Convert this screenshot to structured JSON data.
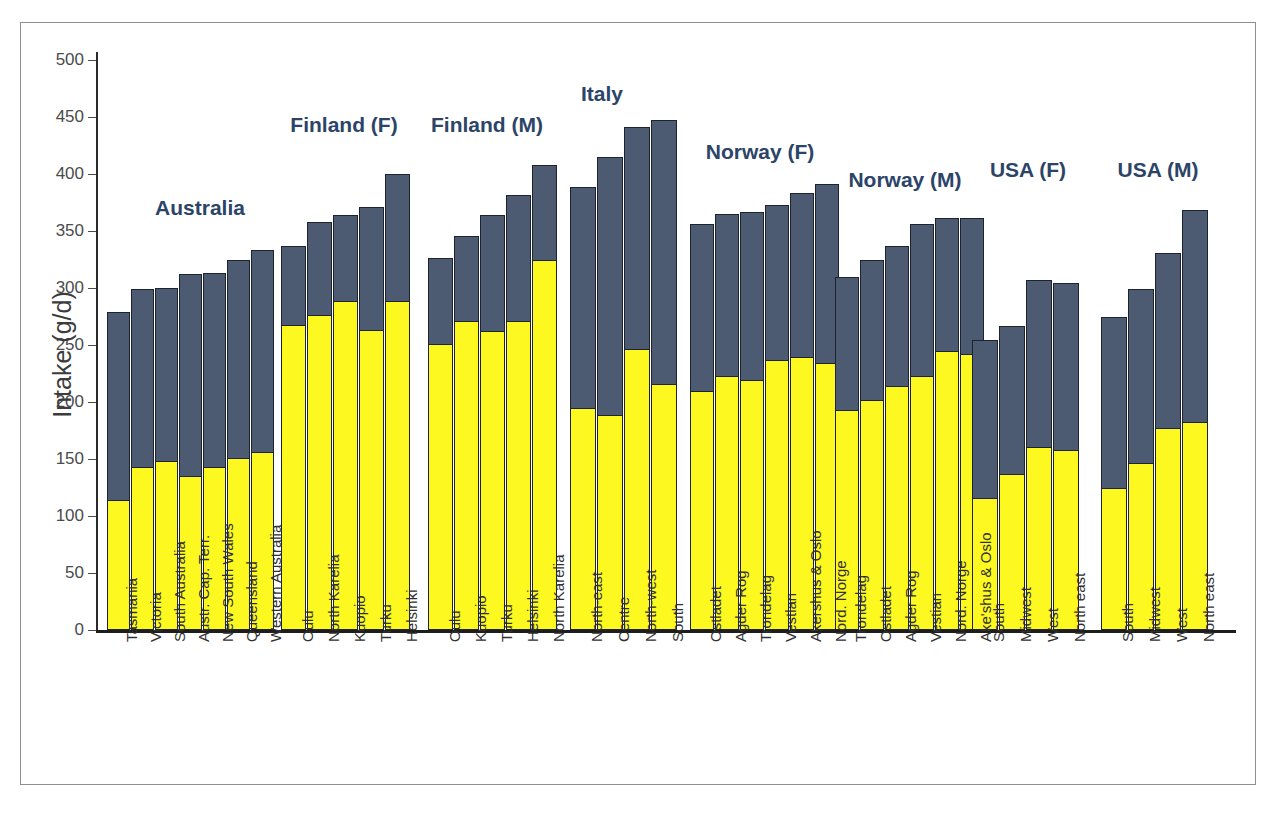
{
  "figure": {
    "y_axis_title": "Intake (g/d)",
    "colors": {
      "upper_segment": "#4d5b72",
      "lower_segment": "#fdf81f",
      "group_title": "#2b4468",
      "axis": "#1d1d1d",
      "frame": "#8e8e8e"
    }
  },
  "chart_data": {
    "type": "bar",
    "subtype": "stacked",
    "title": "",
    "xlabel": "",
    "ylabel": "Intake (g/d)",
    "ylim": [
      0,
      500
    ],
    "yticks": [
      0,
      50,
      100,
      150,
      200,
      250,
      300,
      350,
      400,
      450,
      500
    ],
    "grid": false,
    "legend": "none",
    "series": [
      {
        "name": "lower-segment",
        "color": "#fdf81f"
      },
      {
        "name": "upper-segment",
        "color": "#4d5b72"
      }
    ],
    "groups": [
      {
        "label": "Australia",
        "categories": [
          "Tasmania",
          "Victoria",
          "South Australia",
          "Austr. Cap. Terr.",
          "New South Wales",
          "Queensland",
          "Western Australia"
        ],
        "lower": [
          113,
          142,
          147,
          134,
          142,
          150,
          155
        ],
        "total": [
          279,
          299,
          300,
          312,
          313,
          325,
          333
        ]
      },
      {
        "label": "Finland (F)",
        "categories": [
          "Oulu",
          "North Karelia",
          "Kuopio",
          "Turku",
          "Helsinki"
        ],
        "lower": [
          267,
          275,
          288,
          262,
          288
        ],
        "total": [
          337,
          358,
          364,
          371,
          400
        ]
      },
      {
        "label": "Finland (M)",
        "categories": [
          "Oulu",
          "Kuopio",
          "Turku",
          "Helsinki",
          "North Karelia"
        ],
        "lower": [
          250,
          270,
          261,
          270,
          324
        ],
        "total": [
          326,
          346,
          364,
          382,
          408
        ]
      },
      {
        "label": "Italy",
        "categories": [
          "North-east",
          "Centre",
          "North-west",
          "South"
        ],
        "lower": [
          194,
          188,
          246,
          215
        ],
        "total": [
          389,
          415,
          441,
          447
        ]
      },
      {
        "label": "Norway (F)",
        "categories": [
          "Ostladet",
          "Agder Rog",
          "Trondelag",
          "Vestlan",
          "Akershus & Oslo",
          "Nord. Norge"
        ],
        "lower": [
          209,
          222,
          218,
          236,
          239,
          233
        ],
        "total": [
          356,
          365,
          367,
          373,
          383,
          391
        ]
      },
      {
        "label": "Norway (M)",
        "categories": [
          "Trondelag",
          "Ostladet",
          "Agder Rog",
          "Vestian",
          "Nord. Norge",
          "Ake'shus & Oslo"
        ],
        "lower": [
          192,
          201,
          213,
          222,
          244,
          241
        ],
        "total": [
          310,
          325,
          337,
          356,
          361,
          361
        ]
      },
      {
        "label": "USA (F)",
        "categories": [
          "South",
          "Midwest",
          "West",
          "North east"
        ],
        "lower": [
          115,
          136,
          160,
          157
        ],
        "total": [
          254,
          267,
          307,
          304
        ]
      },
      {
        "label": "USA (M)",
        "categories": [
          "South",
          "Midwest",
          "West",
          "North east"
        ],
        "lower": [
          124,
          146,
          176,
          182
        ],
        "total": [
          275,
          299,
          331,
          368
        ]
      }
    ]
  }
}
